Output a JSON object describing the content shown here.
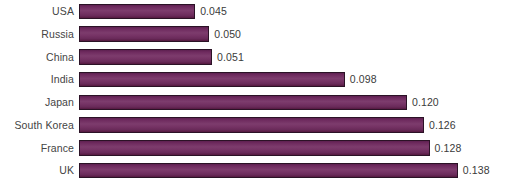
{
  "chart_data": {
    "type": "bar",
    "orientation": "horizontal",
    "title": "",
    "subtitle": "",
    "xlabel": "",
    "ylabel": "",
    "grid": false,
    "legend": null,
    "legend_position": "none",
    "xlim": [
      0,
      0.145
    ],
    "value_format": "0.000",
    "bar_color": "#73356a",
    "bar_edge_color": "#2b1226",
    "label_color": "#444444",
    "value_label_color": "#3a3a3a",
    "background_color": "#ffffff",
    "categories": [
      "USA",
      "Russia",
      "China",
      "India",
      "Japan",
      "South Korea",
      "France",
      "UK"
    ],
    "values": [
      0.045,
      0.05,
      0.051,
      0.098,
      0.12,
      0.126,
      0.128,
      0.138
    ],
    "value_labels": [
      "0.045",
      "0.050",
      "0.051",
      "0.098",
      "0.120",
      "0.126",
      "0.128",
      "0.138"
    ],
    "points": [
      {
        "category": "USA",
        "value": 0.045,
        "label": "0.045"
      },
      {
        "category": "Russia",
        "value": 0.05,
        "label": "0.050"
      },
      {
        "category": "China",
        "value": 0.051,
        "label": "0.051"
      },
      {
        "category": "India",
        "value": 0.098,
        "label": "0.098"
      },
      {
        "category": "Japan",
        "value": 0.12,
        "label": "0.120"
      },
      {
        "category": "South Korea",
        "value": 0.126,
        "label": "0.126"
      },
      {
        "category": "France",
        "value": 0.128,
        "label": "0.128"
      },
      {
        "category": "UK",
        "value": 0.138,
        "label": "0.138"
      }
    ]
  }
}
